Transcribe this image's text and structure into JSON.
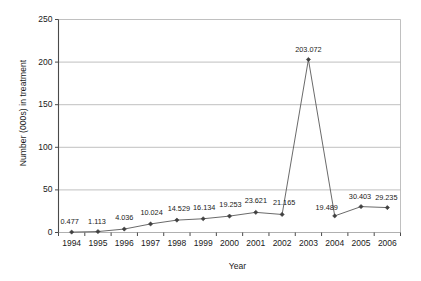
{
  "chart_data": {
    "type": "line",
    "title": "",
    "xlabel": "Year",
    "ylabel": "Number (000s) in treatment",
    "categories": [
      "1994",
      "1995",
      "1996",
      "1997",
      "1998",
      "1999",
      "2000",
      "2001",
      "2002",
      "2003",
      "2004",
      "2005",
      "2006"
    ],
    "values": [
      0.477,
      1.113,
      4.036,
      10.024,
      14.529,
      16.134,
      19.253,
      23.621,
      21.165,
      203.072,
      19.489,
      30.403,
      29.235
    ],
    "point_labels": [
      "0.477",
      "1.113",
      "4.036",
      "10.024",
      "14.529",
      "16.134",
      "19.253",
      "23.621",
      "21.165",
      "203.072",
      "19.489",
      "30.403",
      "29.235"
    ],
    "ylim": [
      0,
      250
    ],
    "y_ticks": [
      0,
      50,
      100,
      150,
      200,
      250
    ],
    "y_tick_labels": [
      "0",
      "50",
      "100",
      "150",
      "200",
      "250"
    ],
    "grid": true,
    "grid_axis": "y",
    "legend": false,
    "series_name": "Number (000s) in treatment",
    "line_color": "#595959",
    "marker_color": "#404040",
    "grid_color": "#b0b0b0",
    "axis_color": "#555555",
    "plot_background": "#ffffff"
  }
}
